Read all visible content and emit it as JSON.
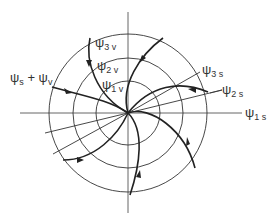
{
  "diagram": {
    "type": "phase-portrait-vortex",
    "labels": {
      "psi3v": {
        "main": "ψ",
        "sub": "3 v"
      },
      "psi2v": {
        "main": "ψ",
        "sub": "2 v"
      },
      "psi1v": {
        "main": "ψ",
        "sub": "1 v"
      },
      "psis_plus_psiv": {
        "a": "ψ",
        "a_sub": "s",
        "plus": " + ",
        "b": "ψ",
        "b_sub": "v"
      },
      "psi3s": {
        "main": "ψ",
        "sub": "3 s"
      },
      "psi2s": {
        "main": "ψ",
        "sub": "2 s"
      },
      "psi1s": {
        "main": "ψ",
        "sub": "1 s"
      }
    },
    "colors": {
      "stroke": "#222222",
      "axis": "#555555",
      "text": "#333333"
    }
  }
}
